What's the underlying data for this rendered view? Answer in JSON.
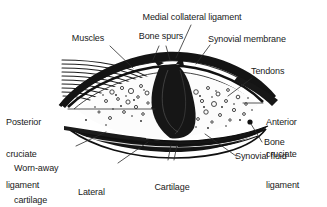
{
  "figure": {
    "background_color": "#ffffff",
    "ink_color": "#1a1a1a",
    "width": 327,
    "height": 207
  },
  "labels": {
    "muscles": "Muscles",
    "bone_spurs": "Bone spurs",
    "medial_collateral_ligament": "Medial collateral ligament",
    "synovial_membrane": "Synovial membrane",
    "tendons": "Tendons",
    "anterior_cruciate_ligament_l1": "Anterior",
    "anterior_cruciate_ligament_l2": "cruciate",
    "anterior_cruciate_ligament_l3": "ligament",
    "posterior_cruciate_ligament_l1": "Posterior",
    "posterior_cruciate_ligament_l2": "cruciate",
    "posterior_cruciate_ligament_l3": "ligament",
    "bone": "Bone",
    "synovial_fluid": "Synovial fluid",
    "cartilage_fragments_l1": "Cartilage",
    "cartilage_fragments_l2": "fragments",
    "cartilage_fragments_l3": "in fluid",
    "lateral_collateral_ligament_l1": "Lateral",
    "lateral_collateral_ligament_l2": "collateral",
    "lateral_collateral_ligament_l3": "ligament",
    "worn_away_cartilage_l1": "Worn-away",
    "worn_away_cartilage_l2": "cartilage"
  }
}
